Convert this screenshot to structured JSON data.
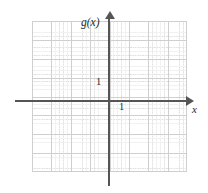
{
  "figure": {
    "width": 208,
    "height": 193,
    "background_color": "#ffffff"
  },
  "axes": {
    "y_axis_label": "g(x)",
    "x_axis_label": "x",
    "axis_color": "#555555",
    "origin_px": {
      "x": 109,
      "y": 101
    }
  },
  "ticks": {
    "y_unit_label": "1",
    "x_unit_label": "1"
  },
  "grid": {
    "major_color": "#cfcfcf",
    "minor_color": "#d8d8d8",
    "major_columns": 8,
    "major_rows": 8,
    "left_px": 32,
    "top_px": 21,
    "width_px": 155,
    "height_px": 151
  },
  "chart_data": {
    "type": "line",
    "title": "",
    "xlabel": "x",
    "ylabel": "g(x)",
    "xlim": [
      -4,
      4
    ],
    "ylim": [
      -4,
      4
    ],
    "xticks": [
      1
    ],
    "yticks": [
      1
    ],
    "xtick_labels": [
      "1"
    ],
    "ytick_labels": [
      "1"
    ],
    "grid": true,
    "minor_grid": true,
    "legend": null,
    "series": [],
    "annotations": [],
    "note": "Empty coordinate grid with labeled axes g(x) and x; unit marks of 1 shown on each axis; no data curve plotted."
  }
}
